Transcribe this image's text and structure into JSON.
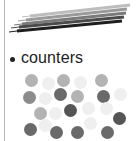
{
  "illustration": {
    "pencils": {
      "icon": "pencils-icon",
      "items": [
        {
          "x1": 30,
          "y1": 16,
          "x2": 130,
          "y2": 5,
          "color": "#bdbdbd",
          "width": 3
        },
        {
          "x1": 26,
          "y1": 20,
          "x2": 127,
          "y2": 9,
          "color": "#9a9a9a",
          "width": 3
        },
        {
          "x1": 22,
          "y1": 24,
          "x2": 126,
          "y2": 13,
          "color": "#7a7a7a",
          "width": 3
        },
        {
          "x1": 19,
          "y1": 27,
          "x2": 124,
          "y2": 17,
          "color": "#4a4a4a",
          "width": 3
        },
        {
          "x1": 17,
          "y1": 31,
          "x2": 122,
          "y2": 21,
          "color": "#1e1e1e",
          "width": 3
        }
      ]
    }
  },
  "list": {
    "items": [
      {
        "label": "counters"
      }
    ]
  },
  "counters": {
    "icon": "counters-icon",
    "diameter": 13,
    "colors": {
      "very_light": "#efefef",
      "light": "#b3b3b3",
      "mid": "#8c8c8c",
      "dark": "#6a6a6a",
      "darker": "#555555"
    },
    "items": [
      {
        "x": 31,
        "y": 80,
        "shade": "light"
      },
      {
        "x": 48,
        "y": 83,
        "shade": "very_light"
      },
      {
        "x": 63,
        "y": 80,
        "shade": "light"
      },
      {
        "x": 80,
        "y": 82,
        "shade": "very_light"
      },
      {
        "x": 101,
        "y": 80,
        "shade": "light"
      },
      {
        "x": 29,
        "y": 97,
        "shade": "mid"
      },
      {
        "x": 45,
        "y": 98,
        "shade": "very_light"
      },
      {
        "x": 60,
        "y": 94,
        "shade": "dark"
      },
      {
        "x": 77,
        "y": 96,
        "shade": "light"
      },
      {
        "x": 103,
        "y": 96,
        "shade": "dark"
      },
      {
        "x": 120,
        "y": 94,
        "shade": "very_light"
      },
      {
        "x": 40,
        "y": 113,
        "shade": "light"
      },
      {
        "x": 55,
        "y": 113,
        "shade": "very_light"
      },
      {
        "x": 70,
        "y": 110,
        "shade": "darker"
      },
      {
        "x": 88,
        "y": 108,
        "shade": "very_light"
      },
      {
        "x": 106,
        "y": 108,
        "shade": "very_light"
      },
      {
        "x": 119,
        "y": 118,
        "shade": "darker"
      },
      {
        "x": 30,
        "y": 129,
        "shade": "dark"
      },
      {
        "x": 45,
        "y": 125,
        "shade": "very_light"
      },
      {
        "x": 56,
        "y": 132,
        "shade": "dark"
      },
      {
        "x": 77,
        "y": 132,
        "shade": "dark"
      },
      {
        "x": 90,
        "y": 123,
        "shade": "very_light"
      },
      {
        "x": 107,
        "y": 132,
        "shade": "dark"
      }
    ]
  }
}
